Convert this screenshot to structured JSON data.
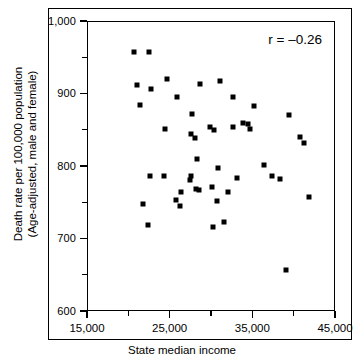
{
  "chart_data": {
    "type": "scatter",
    "title": "",
    "xlabel": "State median income",
    "ylabel": "Death rate per 100,000 population\n(Age-adjusted, male and female)",
    "xlim": [
      15000,
      45000
    ],
    "ylim": [
      600,
      1000
    ],
    "grid": false,
    "legend": null,
    "annotations": [
      {
        "name": "correlation",
        "text": "r = –0.26"
      }
    ],
    "xticks": [
      15000,
      25000,
      35000,
      45000
    ],
    "xtick_labels": [
      "15,000",
      "25,000",
      "35,000",
      "45,000"
    ],
    "xticks_minor": [
      20000,
      30000,
      40000
    ],
    "yticks": [
      600,
      700,
      800,
      900,
      1000
    ],
    "ytick_labels": [
      "600",
      "700",
      "800",
      "900",
      "1,000"
    ],
    "yticks_minor": [
      650,
      750,
      850,
      950
    ],
    "marker": "square",
    "marker_color": "#000000",
    "points": [
      {
        "x": 20600,
        "y": 958
      },
      {
        "x": 22400,
        "y": 958
      },
      {
        "x": 24600,
        "y": 921
      },
      {
        "x": 28600,
        "y": 915
      },
      {
        "x": 31000,
        "y": 919
      },
      {
        "x": 20900,
        "y": 913
      },
      {
        "x": 22600,
        "y": 907
      },
      {
        "x": 25800,
        "y": 897
      },
      {
        "x": 32600,
        "y": 897
      },
      {
        "x": 21300,
        "y": 885
      },
      {
        "x": 35100,
        "y": 884
      },
      {
        "x": 27600,
        "y": 873
      },
      {
        "x": 39300,
        "y": 872
      },
      {
        "x": 24300,
        "y": 853
      },
      {
        "x": 29800,
        "y": 855
      },
      {
        "x": 30200,
        "y": 851
      },
      {
        "x": 32500,
        "y": 855
      },
      {
        "x": 33700,
        "y": 861
      },
      {
        "x": 34300,
        "y": 860
      },
      {
        "x": 34600,
        "y": 853
      },
      {
        "x": 27500,
        "y": 845
      },
      {
        "x": 27900,
        "y": 840
      },
      {
        "x": 40600,
        "y": 842
      },
      {
        "x": 41100,
        "y": 833
      },
      {
        "x": 28200,
        "y": 811
      },
      {
        "x": 36300,
        "y": 803
      },
      {
        "x": 30700,
        "y": 799
      },
      {
        "x": 22500,
        "y": 787
      },
      {
        "x": 24200,
        "y": 788
      },
      {
        "x": 27400,
        "y": 788
      },
      {
        "x": 27300,
        "y": 782
      },
      {
        "x": 33000,
        "y": 785
      },
      {
        "x": 37300,
        "y": 788
      },
      {
        "x": 38200,
        "y": 783
      },
      {
        "x": 30000,
        "y": 773
      },
      {
        "x": 28100,
        "y": 770
      },
      {
        "x": 28400,
        "y": 768
      },
      {
        "x": 26300,
        "y": 765
      },
      {
        "x": 31900,
        "y": 766
      },
      {
        "x": 41700,
        "y": 759
      },
      {
        "x": 25600,
        "y": 755
      },
      {
        "x": 30600,
        "y": 753
      },
      {
        "x": 21700,
        "y": 749
      },
      {
        "x": 26100,
        "y": 746
      },
      {
        "x": 31400,
        "y": 724
      },
      {
        "x": 22200,
        "y": 720
      },
      {
        "x": 30100,
        "y": 717
      },
      {
        "x": 39000,
        "y": 658
      }
    ]
  },
  "axes": {
    "x_title": "State median income",
    "y_title_line1": "Death rate per 100,000 population",
    "y_title_line2": "(Age-adjusted, male and female)"
  }
}
